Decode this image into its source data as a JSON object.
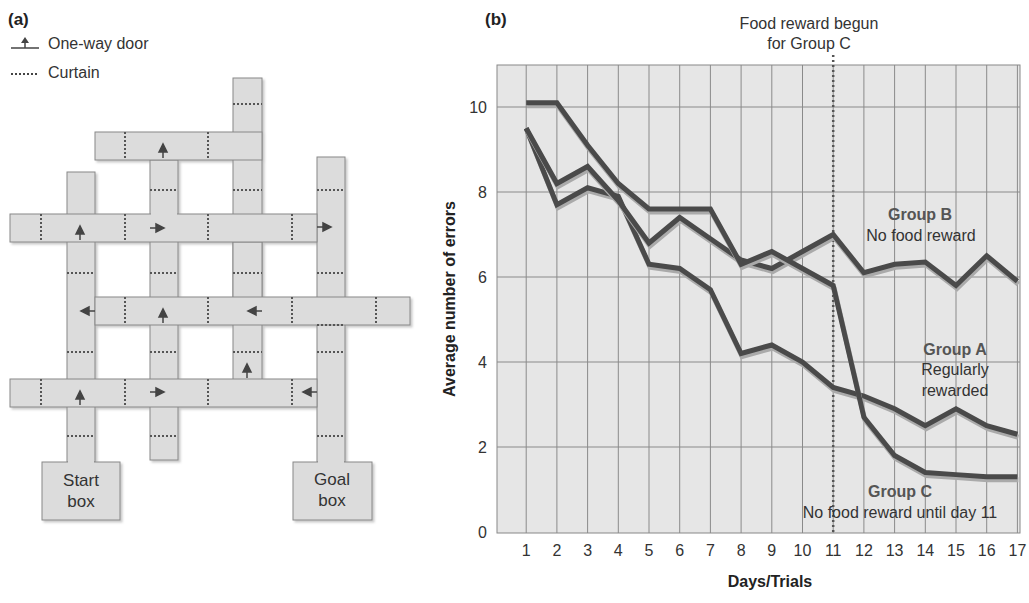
{
  "panel_a": {
    "label": "(a)",
    "legend": [
      {
        "icon": "one-way-door-icon",
        "label": "One-way door"
      },
      {
        "icon": "curtain-icon",
        "label": "Curtain"
      }
    ],
    "start_box": {
      "line1": "Start",
      "line2": "box"
    },
    "goal_box": {
      "line1": "Goal",
      "line2": "box"
    }
  },
  "panel_b": {
    "label": "(b)",
    "annotation": {
      "line1": "Food reward begun",
      "line2": "for Group C"
    },
    "group_labels": {
      "B": {
        "title": "Group B",
        "sub1": "No food reward",
        "sub2": ""
      },
      "A": {
        "title": "Group A",
        "sub1": "Regularly",
        "sub2": "rewarded"
      },
      "C": {
        "title": "Group C",
        "sub1": "No food reward until day 11",
        "sub2": ""
      }
    }
  },
  "chart_data": {
    "type": "line",
    "title": "",
    "xlabel": "Days/Trials",
    "ylabel": "Average number of errors",
    "x": [
      1,
      2,
      3,
      4,
      5,
      6,
      7,
      8,
      9,
      10,
      11,
      12,
      13,
      14,
      15,
      16,
      17
    ],
    "yticks": [
      0,
      2,
      4,
      6,
      8,
      10
    ],
    "ylim": [
      0,
      11
    ],
    "xlim": [
      0,
      17
    ],
    "grid": true,
    "vline": {
      "x": 11,
      "style": "dotted",
      "label": "Food reward begun for Group C"
    },
    "series": [
      {
        "name": "Group A (Regularly rewarded)",
        "values": [
          9.5,
          7.7,
          8.1,
          7.9,
          6.3,
          6.2,
          5.7,
          4.2,
          4.4,
          4.0,
          3.4,
          3.2,
          2.9,
          2.5,
          2.9,
          2.5,
          2.3
        ]
      },
      {
        "name": "Group B (No food reward)",
        "values": [
          9.5,
          8.2,
          8.6,
          7.8,
          6.8,
          7.4,
          6.9,
          6.4,
          6.2,
          6.6,
          7.0,
          6.1,
          6.3,
          6.35,
          5.8,
          6.5,
          5.9
        ]
      },
      {
        "name": "Group C (No food reward until day 11)",
        "values": [
          10.1,
          10.1,
          9.1,
          8.2,
          7.6,
          7.6,
          7.6,
          6.3,
          6.6,
          6.2,
          5.8,
          2.7,
          1.8,
          1.4,
          1.35,
          1.3,
          1.3
        ]
      }
    ]
  }
}
